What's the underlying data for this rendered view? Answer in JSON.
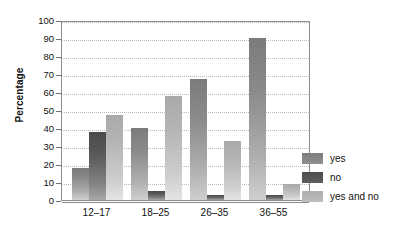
{
  "chart_data": {
    "type": "bar",
    "title": "",
    "xlabel": "",
    "ylabel": "Percentage",
    "ylim": [
      0,
      100
    ],
    "ytick_step": 10,
    "yticks": [
      100,
      90,
      80,
      70,
      60,
      50,
      40,
      30,
      20,
      10,
      0
    ],
    "grid": true,
    "legend_position": "right",
    "categories": [
      "12–17",
      "18–25",
      "26–35",
      "36–55"
    ],
    "series": [
      {
        "name": "yes",
        "color": "#8c8c8c",
        "values": [
          18,
          40,
          67,
          90
        ]
      },
      {
        "name": "no",
        "color": "#545454",
        "values": [
          38,
          5,
          3,
          3
        ]
      },
      {
        "name": "yes and no",
        "color": "#b6b6b6",
        "values": [
          47,
          58,
          33,
          9
        ]
      }
    ]
  },
  "legend": {
    "items": [
      {
        "label": "yes"
      },
      {
        "label": "no"
      },
      {
        "label": "yes and no"
      }
    ]
  }
}
